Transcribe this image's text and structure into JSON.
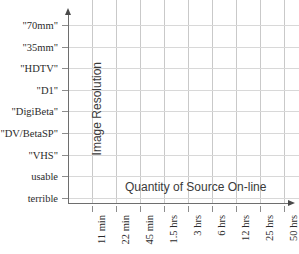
{
  "chart_data": {
    "type": "scatter",
    "title": "",
    "xlabel": "Quantity of Source On-line",
    "ylabel": "Image Resolution",
    "grid": true,
    "legend": null,
    "series": [],
    "values": [],
    "x_tick_labels": [
      "11 min",
      "22 min",
      "45 min",
      "1.5 hrs",
      "3 hrs",
      "6 hrs",
      "12 hrs",
      "25 hrs",
      "50 hrs",
      "100 hrs"
    ],
    "y_tick_labels": [
      "terrible",
      "usable",
      "\"VHS\"",
      "\"DV/BetaSP\"",
      "\"DigiBeta\"",
      "\"D1\"",
      "\"HDTV\"",
      "\"35mm\"",
      "\"70mm\""
    ],
    "y_tick_labels_top_down": [
      "\"70mm\"",
      "\"35mm\"",
      "\"HDTV\"",
      "\"D1\"",
      "\"DigiBeta\"",
      "\"DV/BetaSP\"",
      "\"VHS\"",
      "usable",
      "terrible"
    ],
    "axis_arrows": [
      "up",
      "right"
    ],
    "colors": {
      "axis": "#6e6e6e",
      "grid_vertical": "#c9c9c9",
      "grid_horizontal": "#d8d8d8",
      "tick": "#8d8d8d",
      "tick_label": "#2b2b2b",
      "axis_title": "#3a3a3a",
      "background": "#ffffff"
    }
  }
}
